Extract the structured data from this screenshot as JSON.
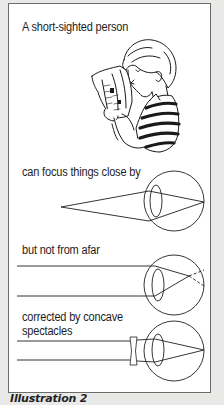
{
  "panel": {
    "title": "A short-sighted person",
    "sections": [
      {
        "label": "can focus things close by",
        "diagram": "near-object-focused-on-retina"
      },
      {
        "label": "but not from afar",
        "diagram": "parallel-rays-focus-in-front-of-retina"
      },
      {
        "label_line1": "corrected by concave",
        "label_line2": "spectacles",
        "diagram": "concave-lens-corrects-focus"
      }
    ],
    "illustration": "person-reading-newspaper-close-to-face"
  },
  "caption": "Illustration 2",
  "colors": {
    "background": "#e9e9e7",
    "panel": "#ffffff",
    "ink": "#1e1e1e",
    "frame": "#6b6b6b"
  }
}
